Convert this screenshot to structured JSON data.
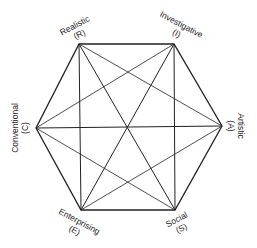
{
  "diagram": {
    "type": "hexagon",
    "vertices": [
      {
        "id": "R",
        "name": "Realistic",
        "abbr": "(R)"
      },
      {
        "id": "I",
        "name": "Investigative",
        "abbr": "(I)"
      },
      {
        "id": "A",
        "name": "Artistic",
        "abbr": "(A)"
      },
      {
        "id": "S",
        "name": "Social",
        "abbr": "(S)"
      },
      {
        "id": "E",
        "name": "Enterprising",
        "abbr": "(E)"
      },
      {
        "id": "C",
        "name": "Conventional",
        "abbr": "(C)"
      }
    ],
    "line_color": "#222222"
  }
}
